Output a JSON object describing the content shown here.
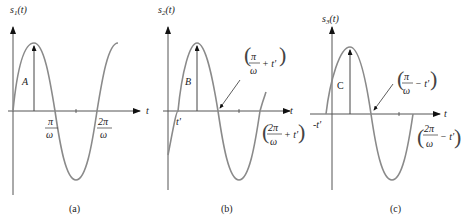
{
  "panels": [
    {
      "caption": "(a)",
      "ylabel": "s",
      "ysub": "1",
      "yarg": "(t)",
      "amp_label": "A",
      "xlabel": "t",
      "tick1_num": "π",
      "tick1_den": "ω",
      "tick2_num": "2π",
      "tick2_den": "ω"
    },
    {
      "caption": "(b)",
      "ylabel": "s",
      "ysub": "2",
      "yarg": "(t)",
      "amp_label": "B",
      "xlabel": "t",
      "shift_label": "t'",
      "ann1_num": "π",
      "ann1_den": "ω",
      "ann1_suffix": "+ t'",
      "ann2_num": "2π",
      "ann2_den": "ω",
      "ann2_suffix": "+ t'"
    },
    {
      "caption": "(c)",
      "ylabel": "s",
      "ysub": "3",
      "yarg": "(t)",
      "amp_label": "C",
      "xlabel": "t",
      "shift_label": "-t'",
      "ann1_num": "π",
      "ann1_den": "ω",
      "ann1_suffix": "− t'",
      "ann2_num": "2π",
      "ann2_den": "ω",
      "ann2_suffix": "− t'"
    }
  ],
  "colors": {
    "curve": "#8a8a8a",
    "axis": "#333333"
  }
}
